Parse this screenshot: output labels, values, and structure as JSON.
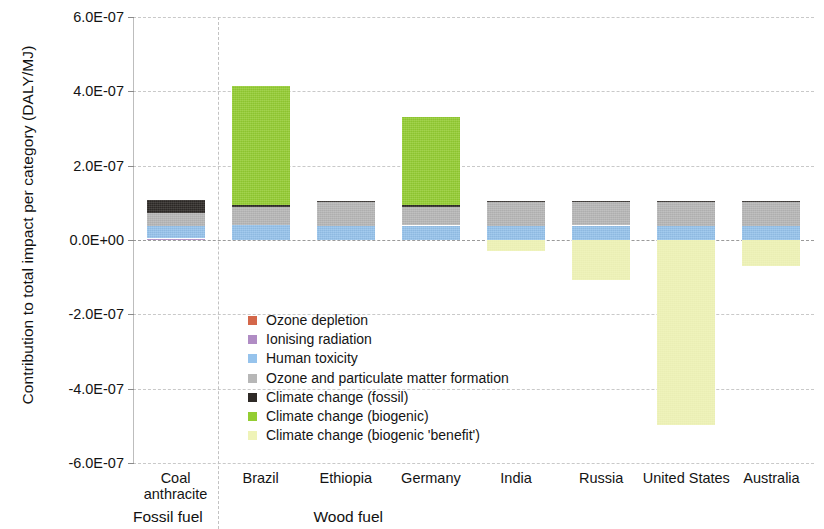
{
  "chart_data": {
    "type": "bar",
    "subtype": "stacked-bar-with-negative",
    "title": "",
    "xlabel": "",
    "ylabel": "Contribution to total impact per category (DALY/MJ)",
    "ylim": [
      -6e-07,
      6e-07
    ],
    "ytick_labels": [
      "6.0E-07",
      "4.0E-07",
      "2.0E-07",
      "0.0E+00",
      "-2.0E-07",
      "-4.0E-07",
      "-6.0E-07"
    ],
    "ytick_values": [
      6e-07,
      4e-07,
      2e-07,
      0.0,
      -2e-07,
      -4e-07,
      -6e-07
    ],
    "grid": true,
    "grid_axis": "y",
    "legend_position": "inside-center-left",
    "categories": [
      "Coal anthracite",
      "Brazil",
      "Ethiopia",
      "Germany",
      "India",
      "Russia",
      "United States",
      "Australia"
    ],
    "category_display": [
      {
        "line1": "Coal",
        "line2": "anthracite"
      },
      {
        "line1": "Brazil",
        "line2": ""
      },
      {
        "line1": "Ethiopia",
        "line2": ""
      },
      {
        "line1": "Germany",
        "line2": ""
      },
      {
        "line1": "India",
        "line2": ""
      },
      {
        "line1": "Russia",
        "line2": ""
      },
      {
        "line1": "United States",
        "line2": ""
      },
      {
        "line1": "Australia",
        "line2": ""
      }
    ],
    "groups": [
      {
        "label": "Fossil fuel",
        "categories": [
          "Coal anthracite"
        ]
      },
      {
        "label": "Wood fuel",
        "categories": [
          "Brazil",
          "Ethiopia",
          "Germany",
          "India",
          "Russia",
          "United States",
          "Australia"
        ]
      }
    ],
    "series": [
      {
        "name": "Ozone depletion",
        "color": "#d4674a",
        "values": [
          0.0,
          0.0,
          0.0,
          0.0,
          0.0,
          0.0,
          0.0,
          0.0
        ]
      },
      {
        "name": "Ionising radiation",
        "color": "#b08cc4",
        "values": [
          4e-09,
          0.0,
          0.0,
          0.0,
          0.0,
          0.0,
          0.0,
          0.0
        ]
      },
      {
        "name": "Human toxicity",
        "color": "#96c3ec",
        "values": [
          3.3e-08,
          4e-08,
          3.8e-08,
          3.9e-08,
          3.8e-08,
          3.9e-08,
          3.8e-08,
          3.8e-08
        ]
      },
      {
        "name": "Ozone and particulate matter formation",
        "color": "#b7b7b7",
        "values": [
          3.5e-08,
          4.8e-08,
          6.4e-08,
          5e-08,
          6.5e-08,
          6.4e-08,
          6.5e-08,
          6.5e-08
        ]
      },
      {
        "name": "Climate change (fossil)",
        "color": "#2e2a27",
        "values": [
          3.5e-08,
          7e-09,
          3e-09,
          6e-09,
          2e-09,
          2e-09,
          2e-09,
          2e-09
        ]
      },
      {
        "name": "Climate change (biogenic)",
        "color": "#94cd32",
        "values": [
          0.0,
          3.2e-07,
          0.0,
          2.35e-07,
          0.0,
          0.0,
          0.0,
          0.0
        ]
      },
      {
        "name": "Climate change (biogenic 'benefit')",
        "color": "#eff3b8",
        "values": [
          0.0,
          0.0,
          0.0,
          0.0,
          -3e-08,
          -1.08e-07,
          -4.97e-07,
          -7e-08
        ]
      }
    ],
    "stack_totals_positive": [
      1.07e-07,
      4.15e-07,
      1.05e-07,
      3.3e-07,
      1.05e-07,
      1.05e-07,
      1.05e-07,
      1.05e-07
    ],
    "stack_totals_negative": [
      0.0,
      0.0,
      0.0,
      0.0,
      -3e-08,
      -1.08e-07,
      -4.97e-07,
      -7e-08
    ]
  },
  "legend": {
    "items": [
      {
        "label": "Ozone depletion",
        "color": "#d4674a"
      },
      {
        "label": "Ionising radiation",
        "color": "#b08cc4"
      },
      {
        "label": "Human toxicity",
        "color": "#96c3ec"
      },
      {
        "label": "Ozone and particulate matter formation",
        "color": "#b7b7b7"
      },
      {
        "label": "Climate change (fossil)",
        "color": "#2e2a27"
      },
      {
        "label": "Climate change (biogenic)",
        "color": "#94cd32"
      },
      {
        "label": "Climate change (biogenic 'benefit')",
        "color": "#eff3b8"
      }
    ]
  }
}
